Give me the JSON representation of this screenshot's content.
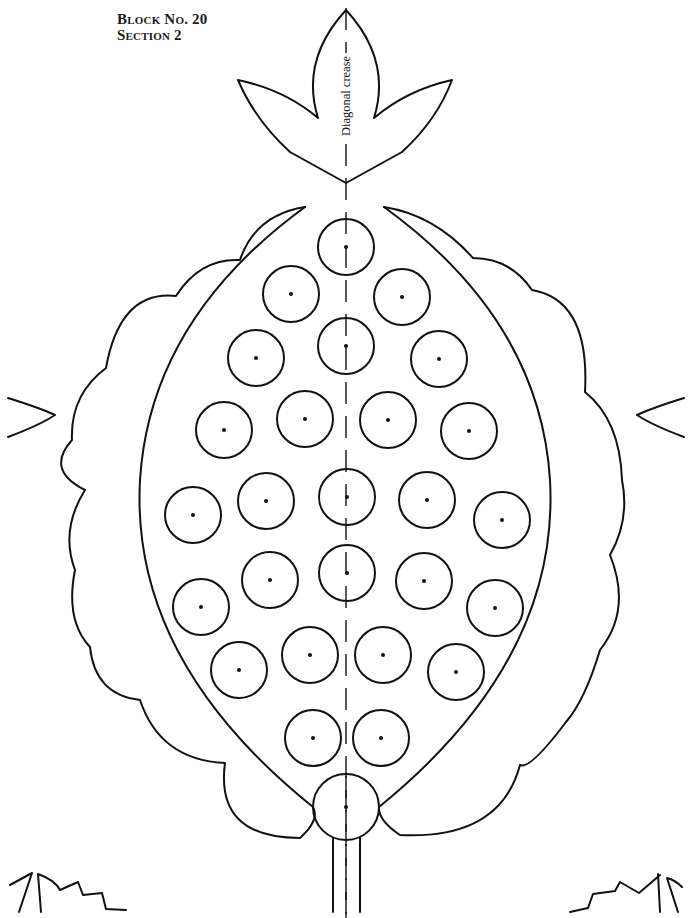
{
  "header": {
    "block_label": "Block No. 20",
    "section_label": "Section 2"
  },
  "annotations": {
    "crease_label": "Diagonal crease"
  },
  "pattern": {
    "type": "applique-template",
    "motif": "stylized pineapple / pomegranate with three-lobed leaf top, scalloped outer body, seed circles and stem",
    "seed_circle_count": 26,
    "colors": {
      "line": "#111111",
      "background": "#ffffff"
    }
  }
}
